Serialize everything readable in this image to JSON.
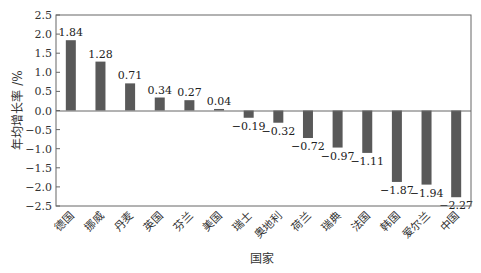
{
  "chart_data": {
    "type": "bar",
    "title": "",
    "xlabel": "国家",
    "ylabel": "年均增长率 /%",
    "ylim": [
      -2.5,
      2.5
    ],
    "yticks": [
      2.5,
      2.0,
      1.5,
      1.0,
      0.5,
      0.0,
      -0.5,
      -1.0,
      -1.5,
      -2.0,
      -2.5
    ],
    "ytick_labels": [
      "2.5",
      "2.0",
      "1.5",
      "1.0",
      "0.5",
      "0.0",
      "−0.5",
      "−1.0",
      "−1.5",
      "−2.0",
      "−2.5"
    ],
    "grid": false,
    "legend": null,
    "bar_color": "#595959",
    "categories": [
      "德国",
      "挪威",
      "丹麦",
      "英国",
      "芬兰",
      "美国",
      "瑞士",
      "奥地利",
      "荷兰",
      "瑞典",
      "法国",
      "韩国",
      "爱尔兰",
      "中国"
    ],
    "values": [
      1.84,
      1.28,
      0.71,
      0.34,
      0.27,
      0.04,
      -0.19,
      -0.32,
      -0.72,
      -0.97,
      -1.11,
      -1.87,
      -1.94,
      -2.27
    ],
    "value_labels": [
      "1.84",
      "1.28",
      "0.71",
      "0.34",
      "0.27",
      "0.04",
      "−0.19",
      "−0.32",
      "−0.72",
      "−0.97",
      "−1.11",
      "−1.87",
      "−1.94",
      "−2.27"
    ]
  }
}
